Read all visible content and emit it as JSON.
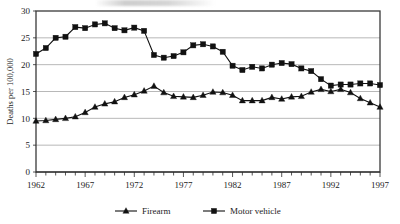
{
  "chart_data": {
    "type": "line",
    "title": "",
    "xlabel": "",
    "ylabel": "Deaths per 100,000",
    "xlim": [
      1962,
      1997
    ],
    "ylim": [
      0,
      30
    ],
    "ytick_values": [
      0,
      5,
      10,
      15,
      20,
      25,
      30
    ],
    "ytick_labels": [
      "0",
      "5",
      "10",
      "15",
      "20",
      "25",
      "30"
    ],
    "xtick_values": [
      1962,
      1967,
      1972,
      1977,
      1982,
      1987,
      1992,
      1997
    ],
    "xtick_labels": [
      "1962",
      "1967",
      "1972",
      "1977",
      "1982",
      "1987",
      "1992",
      "1997"
    ],
    "minor_xticks_every": 1,
    "grid": "horizontal",
    "legend_position": "bottom",
    "x": [
      1962,
      1963,
      1964,
      1965,
      1966,
      1967,
      1968,
      1969,
      1970,
      1971,
      1972,
      1973,
      1974,
      1975,
      1976,
      1977,
      1978,
      1979,
      1980,
      1981,
      1982,
      1983,
      1984,
      1985,
      1986,
      1987,
      1988,
      1989,
      1990,
      1991,
      1992,
      1993,
      1994,
      1995,
      1996,
      1997
    ],
    "series": [
      {
        "name": "Firearm",
        "marker": "triangle",
        "color": "#111111",
        "values": [
          9.5,
          9.6,
          9.8,
          10.0,
          10.3,
          11.1,
          12.1,
          12.7,
          13.1,
          13.9,
          14.4,
          15.1,
          16.0,
          14.8,
          14.1,
          14.0,
          13.9,
          14.3,
          14.9,
          14.8,
          14.3,
          13.3,
          13.3,
          13.3,
          13.9,
          13.6,
          14.0,
          14.1,
          14.9,
          15.4,
          15.0,
          15.4,
          14.8,
          13.7,
          12.9,
          12.1
        ]
      },
      {
        "name": "Motor vehicle",
        "marker": "square",
        "color": "#111111",
        "values": [
          22.0,
          23.1,
          25.0,
          25.2,
          27.0,
          26.8,
          27.5,
          27.7,
          26.8,
          26.4,
          26.9,
          26.3,
          21.8,
          21.3,
          21.6,
          22.3,
          23.6,
          23.8,
          23.4,
          22.4,
          19.8,
          19.0,
          19.6,
          19.3,
          20.0,
          20.3,
          20.1,
          19.3,
          18.8,
          17.3,
          16.1,
          16.3,
          16.3,
          16.5,
          16.5,
          16.2
        ]
      }
    ]
  },
  "legend": {
    "entries": [
      {
        "label": "Firearm",
        "marker": "triangle"
      },
      {
        "label": "Motor vehicle",
        "marker": "square"
      }
    ]
  }
}
